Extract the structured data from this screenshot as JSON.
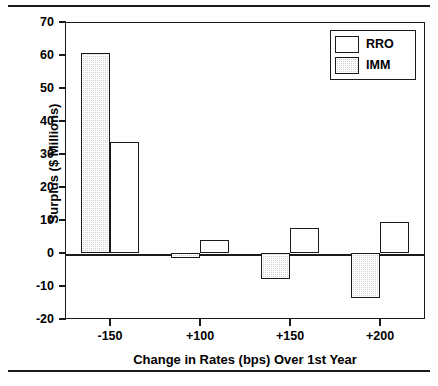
{
  "chart_data": {
    "type": "bar",
    "title": "",
    "xlabel": "Change in Rates (bps) Over 1st Year",
    "ylabel": "Surplus ($ Millions)",
    "categories": [
      "-150",
      "+100",
      "+150",
      "+200"
    ],
    "series": [
      {
        "name": "RRO",
        "values": [
          33.5,
          4.0,
          7.5,
          9.3
        ],
        "fill": "white"
      },
      {
        "name": "IMM",
        "values": [
          60.5,
          -1.5,
          -7.8,
          -13.5
        ],
        "fill": "stipple-gray"
      }
    ],
    "ylim": [
      -20,
      70
    ],
    "ytick_labels": [
      "70",
      "60",
      "50",
      "40",
      "30",
      "20",
      "10",
      "0",
      "-10",
      "-20"
    ],
    "ytick_values": [
      70,
      60,
      50,
      40,
      30,
      20,
      10,
      0,
      -10,
      -20
    ],
    "grid": false,
    "legend_position": "top-right",
    "legend_entries": [
      "RRO",
      "IMM"
    ],
    "zero_line": true,
    "colors": {
      "axis": "#1a1a1a",
      "rro_fill": "#ffffff",
      "imm_fill": "#d2d2d2",
      "text": "#000000"
    }
  }
}
